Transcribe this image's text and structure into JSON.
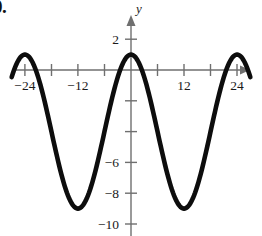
{
  "problem": {
    "number_label": "0."
  },
  "chart_data": {
    "type": "line",
    "title": "",
    "subtitle": "",
    "xlabel": "",
    "ylabel": "y",
    "y_axis_name": "y",
    "x_axis_name": "",
    "grid": false,
    "legend": null,
    "xlim": [
      -28,
      28
    ],
    "ylim": [
      -10.8,
      2.9
    ],
    "x_ticks": [
      -24,
      -18,
      -12,
      -6,
      6,
      12,
      18,
      24
    ],
    "x_tick_labels": [
      "−24",
      "",
      "−12",
      "",
      "",
      "12",
      "",
      "24"
    ],
    "y_ticks": [
      2,
      -2,
      -4,
      -6,
      -8,
      -10
    ],
    "y_tick_labels": [
      "2",
      "",
      "",
      "−6",
      "−8",
      "−10"
    ],
    "x_tick_interval": 6,
    "y_tick_interval": 2,
    "curve": {
      "description": "cosine wave",
      "amplitude": 5,
      "midline": -4,
      "period": 24,
      "maximum": 1,
      "minimum": -9,
      "maxima_x": [
        -24,
        0,
        24
      ],
      "minima_x": [
        -12,
        12
      ],
      "x_start": -27,
      "x_end": 27,
      "color": "#0d0d0d"
    },
    "x": [
      -27,
      -26,
      -25,
      -24,
      -23,
      -22,
      -21,
      -20,
      -19,
      -18,
      -17,
      -16,
      -15,
      -14,
      -13,
      -12,
      -11,
      -10,
      -9,
      -8,
      -7,
      -6,
      -5,
      -4,
      -3,
      -2,
      -1,
      0,
      1,
      2,
      3,
      4,
      5,
      6,
      7,
      8,
      9,
      10,
      11,
      12,
      13,
      14,
      15,
      16,
      17,
      18,
      19,
      20,
      21,
      22,
      23,
      24,
      25,
      26,
      27
    ],
    "y": [
      -0.29,
      0.17,
      0.66,
      1.0,
      0.66,
      0.17,
      -0.29,
      -1.5,
      -2.5,
      -4.0,
      -5.5,
      -6.5,
      -7.7,
      -8.53,
      -8.87,
      -9.0,
      -8.87,
      -8.53,
      -7.7,
      -6.5,
      -5.5,
      -4.0,
      -2.5,
      -1.5,
      -0.29,
      0.17,
      0.66,
      1.0,
      0.66,
      0.17,
      -0.29,
      -1.5,
      -2.5,
      -4.0,
      -5.5,
      -6.5,
      -7.7,
      -8.53,
      -8.87,
      -9.0,
      -8.87,
      -8.53,
      -7.7,
      -6.5,
      -5.5,
      -4.0,
      -2.5,
      -1.5,
      -0.29,
      0.17,
      0.66,
      1.0,
      0.66,
      0.17,
      -0.29
    ]
  },
  "axes": {
    "origin_px": {
      "x": 131,
      "y": 70
    },
    "px_per_x_unit": 4.42,
    "px_per_y_unit": 15.4,
    "axis_color": "#6f6f6f",
    "has_x_arrow": true,
    "has_y_arrow": true
  }
}
